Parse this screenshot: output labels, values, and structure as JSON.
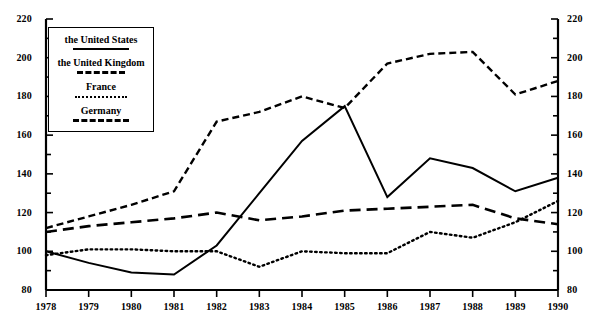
{
  "chart_data": {
    "type": "line",
    "title": "",
    "xlabel": "",
    "ylabel": "",
    "categories": [
      1978,
      1979,
      1980,
      1981,
      1982,
      1983,
      1984,
      1985,
      1986,
      1987,
      1988,
      1989,
      1990
    ],
    "x_tick_labels": [
      "1978",
      "1979",
      "1980",
      "1981",
      "1982",
      "1983",
      "1984",
      "1985",
      "1986",
      "1987",
      "1988",
      "1989",
      "1990"
    ],
    "y_tick_labels": [
      "220",
      "200",
      "180",
      "160",
      "140",
      "120",
      "100",
      "80"
    ],
    "y_tick_values": [
      220,
      200,
      180,
      160,
      140,
      120,
      100,
      80
    ],
    "y_minor_step": 10,
    "ylim": [
      80,
      220
    ],
    "grid": false,
    "dual_y_axis": true,
    "legend_position": "upper-left-inside",
    "series": [
      {
        "name": "the United States",
        "style": "solid",
        "values": [
          100,
          94,
          89,
          88,
          103,
          130,
          157,
          175,
          128,
          148,
          143,
          131,
          138
        ]
      },
      {
        "name": "the United Kingdom",
        "style": "dashed",
        "values": [
          112,
          118,
          124,
          131,
          167,
          172,
          180,
          174,
          197,
          202,
          203,
          181,
          188
        ]
      },
      {
        "name": "France",
        "style": "dotted",
        "values": [
          98,
          101,
          101,
          100,
          100,
          92,
          100,
          99,
          99,
          110,
          107,
          115,
          126
        ]
      },
      {
        "name": "Germany",
        "style": "longdash",
        "values": [
          110,
          113,
          115,
          117,
          120,
          116,
          118,
          121,
          122,
          123,
          124,
          117,
          114
        ]
      }
    ]
  },
  "legend": {
    "items": [
      {
        "label": "the United States",
        "style": "solid"
      },
      {
        "label": "the United Kingdom",
        "style": "dashed"
      },
      {
        "label": "France",
        "style": "dotted"
      },
      {
        "label": "Germany",
        "style": "longdash"
      }
    ]
  },
  "colors": {
    "line": "#000000",
    "axis": "#000000",
    "background": "#ffffff"
  }
}
